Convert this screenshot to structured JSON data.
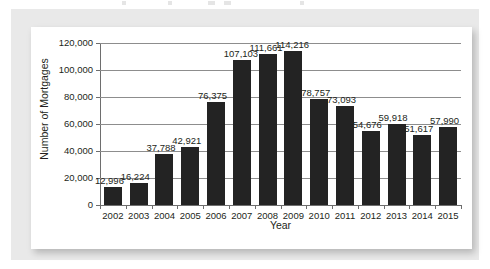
{
  "chart_data": {
    "type": "bar",
    "title": "",
    "subtitle": "",
    "xlabel": "Year",
    "ylabel": "Number of Mortgages",
    "categories": [
      "2002",
      "2003",
      "2004",
      "2005",
      "2006",
      "2007",
      "2008",
      "2009",
      "2010",
      "2011",
      "2012",
      "2013",
      "2014",
      "2015"
    ],
    "values": [
      12996,
      16224,
      37788,
      42921,
      76375,
      107103,
      111661,
      114216,
      78757,
      73093,
      54676,
      59918,
      51617,
      57990
    ],
    "value_labels": [
      "12,996",
      "16,224",
      "37,788",
      "42,921",
      "76,375",
      "107,103",
      "111,661",
      "114,216",
      "78,757",
      "73,093",
      "54,676",
      "59,918",
      "51,617",
      "57,990"
    ],
    "ylim": [
      0,
      120000
    ],
    "ytick_values": [
      0,
      20000,
      40000,
      60000,
      80000,
      100000,
      120000
    ],
    "ytick_labels": [
      "0",
      "20,000",
      "40,000",
      "60,000",
      "80,000",
      "100,000",
      "120,000"
    ],
    "grid": true,
    "grid_axis": "y",
    "legend": false,
    "legend_position": "none",
    "data_labels": true,
    "series": [
      {
        "name": "Number of Mortgages",
        "color": "#232323",
        "values": [
          12996,
          16224,
          37788,
          42921,
          76375,
          107103,
          111661,
          114216,
          78757,
          73093,
          54676,
          59918,
          51617,
          57990
        ]
      }
    ]
  },
  "colors": {
    "bar": "#232323",
    "gridline": "#8d8d8d",
    "axis": "#6e6e6e",
    "text": "#231f20",
    "card_background": "#ffffff",
    "frame_background": "#e9e9e9",
    "page_background": "#ffffff"
  }
}
